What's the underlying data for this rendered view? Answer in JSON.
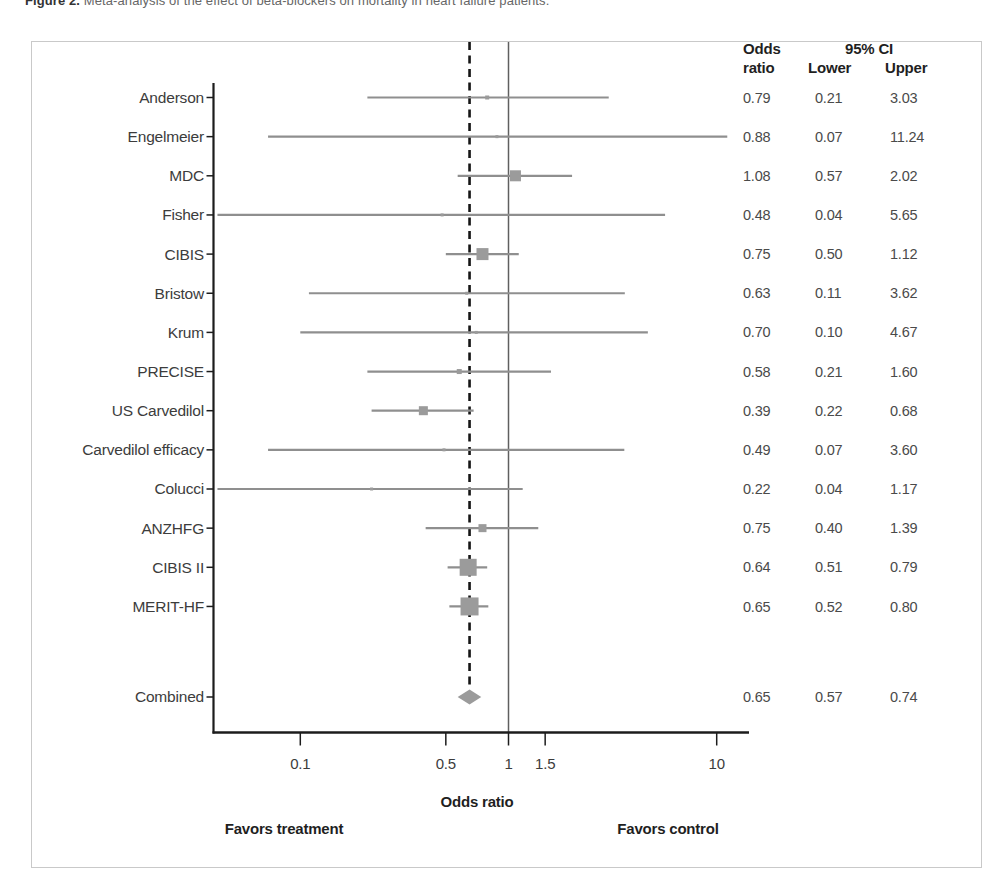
{
  "caption": {
    "prefix": "Figure 2.",
    "text": "Meta-analysis of the effect of beta-blockers on mortality in heart failure patients."
  },
  "columns": {
    "odds_line1": "Odds",
    "odds_line2": "ratio",
    "ci_header": "95% CI",
    "lower": "Lower",
    "upper": "Upper"
  },
  "chart_data": {
    "type": "forest",
    "xlabel": "Odds ratio",
    "x_scale": "log",
    "x_ticks": [
      0.1,
      0.5,
      1,
      1.5,
      10
    ],
    "x_range": [
      0.038,
      14.5
    ],
    "reference_line": 1.0,
    "pooled_line": 0.65,
    "footer_left": "Favors treatment",
    "footer_right": "Favors control",
    "studies": [
      {
        "label": "Anderson",
        "or": 0.79,
        "lower": 0.21,
        "upper": 3.03,
        "marker_size": 4
      },
      {
        "label": "Engelmeier",
        "or": 0.88,
        "lower": 0.07,
        "upper": 11.24,
        "marker_size": 3
      },
      {
        "label": "MDC",
        "or": 1.08,
        "lower": 0.57,
        "upper": 2.02,
        "marker_size": 11
      },
      {
        "label": "Fisher",
        "or": 0.48,
        "lower": 0.04,
        "upper": 5.65,
        "marker_size": 3
      },
      {
        "label": "CIBIS",
        "or": 0.75,
        "lower": 0.5,
        "upper": 1.12,
        "marker_size": 12
      },
      {
        "label": "Bristow",
        "or": 0.63,
        "lower": 0.11,
        "upper": 3.62,
        "marker_size": 3
      },
      {
        "label": "Krum",
        "or": 0.7,
        "lower": 0.1,
        "upper": 4.67,
        "marker_size": 3
      },
      {
        "label": "PRECISE",
        "or": 0.58,
        "lower": 0.21,
        "upper": 1.6,
        "marker_size": 5
      },
      {
        "label": "US Carvedilol",
        "or": 0.39,
        "lower": 0.22,
        "upper": 0.68,
        "marker_size": 9
      },
      {
        "label": "Carvedilol efficacy",
        "or": 0.49,
        "lower": 0.07,
        "upper": 3.6,
        "marker_size": 3
      },
      {
        "label": "Colucci",
        "or": 0.22,
        "lower": 0.04,
        "upper": 1.17,
        "marker_size": 3
      },
      {
        "label": "ANZHFG",
        "or": 0.75,
        "lower": 0.4,
        "upper": 1.39,
        "marker_size": 8
      },
      {
        "label": "CIBIS II",
        "or": 0.64,
        "lower": 0.51,
        "upper": 0.79,
        "marker_size": 17
      },
      {
        "label": "MERIT-HF",
        "or": 0.65,
        "lower": 0.52,
        "upper": 0.8,
        "marker_size": 18
      }
    ],
    "combined": {
      "label": "Combined",
      "or": 0.65,
      "lower": 0.57,
      "upper": 0.74
    },
    "colors": {
      "marker": "#9b9b9b",
      "ci_line": "#8f8f8f",
      "axis": "#1c1c1c",
      "dashed_line": "#151515",
      "reference_line": "#5f5f5f",
      "box_border": "#c9c9c9",
      "label_text": "#3c3c3c",
      "value_text": "#4a4a4a"
    }
  }
}
